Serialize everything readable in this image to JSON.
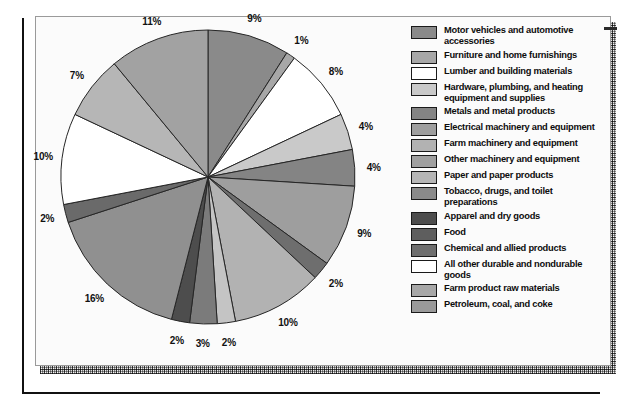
{
  "chart_data": {
    "type": "pie",
    "title": "",
    "legend_position": "right",
    "unit": "percent",
    "categories": [
      "Motor vehicles and automotive accessories",
      "Furniture and home furnishings",
      "Lumber and building materials",
      "Hardware, plumbing, and heating equipment and supplies",
      "Metals and metal products",
      "Electrical machinery and equipment",
      "Farm machinery and equipment",
      "Other machinery and equipment",
      "Paper and paper products",
      "Tobacco, drugs, and toilet preparations",
      "Apparel and dry goods",
      "Food",
      "Chemical and allied products",
      "All other durable and nondurable goods",
      "Farm product raw materials",
      "Petroleum, coal, and coke"
    ],
    "values": [
      9,
      1,
      8,
      4,
      4,
      9,
      2,
      10,
      2,
      3,
      2,
      16,
      2,
      10,
      7,
      11
    ],
    "labels": [
      "9%",
      "1%",
      "8%",
      "4%",
      "4%",
      "9%",
      "2%",
      "10%",
      "2%",
      "3%",
      "2%",
      "16%",
      "2%",
      "10%",
      "7%",
      "11%"
    ],
    "colors": [
      "#8a8a8a",
      "#a7a7a7",
      "#ffffff",
      "#c9c9c9",
      "#848484",
      "#9e9e9e",
      "#6e6e6e",
      "#b2b2b2",
      "#c4c4c4",
      "#7b7b7b",
      "#4d4d4d",
      "#909090",
      "#6a6a6a",
      "#ffffff",
      "#b6b6b6",
      "#a2a2a2"
    ],
    "slices": [
      {
        "label": "9%",
        "value": 9,
        "category": "Motor vehicles and automotive accessories",
        "color": "#8a8a8a"
      },
      {
        "label": "1%",
        "value": 1,
        "category": "Furniture and home furnishings",
        "color": "#a7a7a7"
      },
      {
        "label": "8%",
        "value": 8,
        "category": "Lumber and building materials",
        "color": "#ffffff"
      },
      {
        "label": "4%",
        "value": 4,
        "category": "Hardware, plumbing, and heating equipment and supplies",
        "color": "#c9c9c9"
      },
      {
        "label": "4%",
        "value": 4,
        "category": "Metals and metal products",
        "color": "#848484"
      },
      {
        "label": "9%",
        "value": 9,
        "category": "Electrical machinery and equipment",
        "color": "#9e9e9e"
      },
      {
        "label": "2%",
        "value": 2,
        "category": "Farm machinery and equipment",
        "color": "#6e6e6e"
      },
      {
        "label": "10%",
        "value": 10,
        "category": "Other machinery and equipment",
        "color": "#b2b2b2"
      },
      {
        "label": "2%",
        "value": 2,
        "category": "Paper and paper products",
        "color": "#c4c4c4"
      },
      {
        "label": "3%",
        "value": 3,
        "category": "Tobacco, drugs, and toilet preparations",
        "color": "#7b7b7b"
      },
      {
        "label": "2%",
        "value": 2,
        "category": "Apparel and dry goods",
        "color": "#4d4d4d"
      },
      {
        "label": "16%",
        "value": 16,
        "category": "Food",
        "color": "#909090"
      },
      {
        "label": "2%",
        "value": 2,
        "category": "Chemical and allied products",
        "color": "#6a6a6a"
      },
      {
        "label": "10%",
        "value": 10,
        "category": "All other durable and nondurable goods",
        "color": "#ffffff"
      },
      {
        "label": "7%",
        "value": 7,
        "category": "Farm product raw materials",
        "color": "#b6b6b6"
      },
      {
        "label": "11%",
        "value": 11,
        "category": "Petroleum, coal, and coke",
        "color": "#a2a2a2"
      }
    ]
  },
  "legend": {
    "items": [
      {
        "label": "Motor vehicles and automotive accessories",
        "color": "#8a8a8a"
      },
      {
        "label": "Furniture and home furnishings",
        "color": "#a7a7a7"
      },
      {
        "label": "Lumber and building materials",
        "color": "#ffffff"
      },
      {
        "label": "Hardware, plumbing, and heating equipment and supplies",
        "color": "#c9c9c9"
      },
      {
        "label": "Metals and metal products",
        "color": "#848484"
      },
      {
        "label": "Electrical machinery and equipment",
        "color": "#9e9e9e"
      },
      {
        "label": "Farm machinery and equipment",
        "color": "#b2b2b2"
      },
      {
        "label": "Other machinery and equipment",
        "color": "#a0a0a0"
      },
      {
        "label": "Paper and paper products",
        "color": "#b6b6b6"
      },
      {
        "label": "Tobacco, drugs, and toilet preparations",
        "color": "#8a8a8a"
      },
      {
        "label": "Apparel and dry goods",
        "color": "#4d4d4d"
      },
      {
        "label": "Food",
        "color": "#5e5e5e"
      },
      {
        "label": "Chemical and allied products",
        "color": "#6e6e6e"
      },
      {
        "label": "All other durable and nondurable goods",
        "color": "#ffffff"
      },
      {
        "label": "Farm product raw materials",
        "color": "#a7a7a7"
      },
      {
        "label": "Petroleum, coal, and coke",
        "color": "#9a9a9a"
      }
    ]
  }
}
